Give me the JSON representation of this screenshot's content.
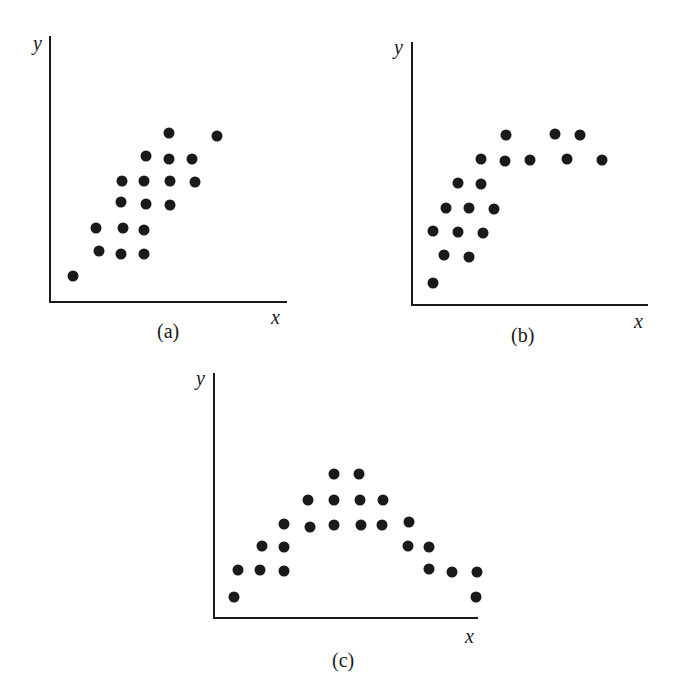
{
  "chart_data": [
    {
      "type": "scatter",
      "panel": "a",
      "caption": "(a)",
      "xlabel": "x",
      "ylabel": "y",
      "description": "Positive linear correlation",
      "axes": {
        "origin": [
          50,
          301
        ],
        "x_end": 287,
        "y_top": 36
      },
      "points": [
        [
          73,
          276
        ],
        [
          99,
          251
        ],
        [
          121,
          254
        ],
        [
          144,
          254
        ],
        [
          96,
          228
        ],
        [
          123,
          228
        ],
        [
          144,
          230
        ],
        [
          121,
          202
        ],
        [
          146,
          204
        ],
        [
          170,
          205
        ],
        [
          122,
          181
        ],
        [
          144,
          181
        ],
        [
          170,
          181
        ],
        [
          195,
          182
        ],
        [
          146,
          156
        ],
        [
          169,
          159
        ],
        [
          192,
          159
        ],
        [
          169,
          133
        ],
        [
          217,
          136
        ]
      ]
    },
    {
      "type": "scatter",
      "panel": "b",
      "caption": "(b)",
      "xlabel": "x",
      "ylabel": "y",
      "description": "Non-linear (saturating/curvilinear) correlation",
      "axes": {
        "origin": [
          412,
          305
        ],
        "x_end": 648,
        "y_top": 42
      },
      "points": [
        [
          433,
          283
        ],
        [
          444,
          255
        ],
        [
          469,
          257
        ],
        [
          433,
          231
        ],
        [
          458,
          232
        ],
        [
          483,
          233
        ],
        [
          446,
          208
        ],
        [
          469,
          208
        ],
        [
          494,
          209
        ],
        [
          458,
          183
        ],
        [
          481,
          184
        ],
        [
          481,
          159
        ],
        [
          505,
          161
        ],
        [
          530,
          160
        ],
        [
          567,
          159
        ],
        [
          602,
          160
        ],
        [
          506,
          135
        ],
        [
          555,
          134
        ],
        [
          580,
          135
        ]
      ]
    },
    {
      "type": "scatter",
      "panel": "c",
      "caption": "(c)",
      "xlabel": "x",
      "ylabel": "y",
      "description": "Inverted-U (curvilinear) relationship",
      "axes": {
        "origin": [
          214,
          617
        ],
        "x_end": 478,
        "y_top": 373
      },
      "points": [
        [
          234,
          597
        ],
        [
          238,
          570
        ],
        [
          262,
          546
        ],
        [
          260,
          570
        ],
        [
          284,
          524
        ],
        [
          284,
          547
        ],
        [
          284,
          571
        ],
        [
          308,
          500
        ],
        [
          310,
          527
        ],
        [
          334,
          474
        ],
        [
          334,
          500
        ],
        [
          334,
          525
        ],
        [
          359,
          474
        ],
        [
          360,
          500
        ],
        [
          361,
          525
        ],
        [
          383,
          500
        ],
        [
          382,
          525
        ],
        [
          409,
          522
        ],
        [
          408,
          546
        ],
        [
          429,
          547
        ],
        [
          429,
          569
        ],
        [
          452,
          572
        ],
        [
          477,
          572
        ],
        [
          476,
          597
        ]
      ]
    }
  ],
  "labels": {
    "a": {
      "caption": "(a)",
      "x": "x",
      "y": "y"
    },
    "b": {
      "caption": "(b)",
      "x": "x",
      "y": "y"
    },
    "c": {
      "caption": "(c)",
      "x": "x",
      "y": "y"
    }
  },
  "colors": {
    "ink": "#1a1a1a",
    "background": "#ffffff"
  }
}
